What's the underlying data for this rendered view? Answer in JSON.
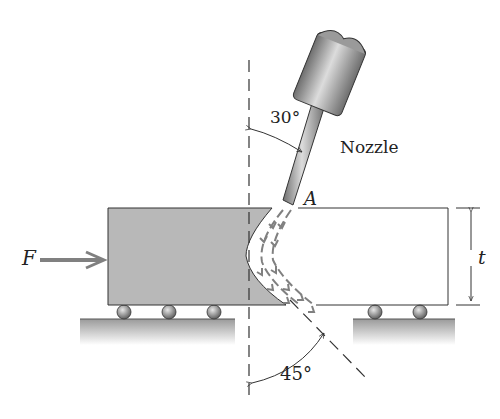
{
  "figure": {
    "labels": {
      "force": "F",
      "point": "A",
      "thickness": "t",
      "nozzle": "Nozzle",
      "angle_top": "30°",
      "angle_bottom": "45°"
    },
    "angles": {
      "nozzle_from_vertical_deg": 30,
      "jet_exit_from_vertical_deg": 45
    },
    "colors": {
      "block_fill": "#b8b8b8",
      "arrow": "#808080",
      "outline": "#333333",
      "ground": "#a8a8a8"
    }
  }
}
